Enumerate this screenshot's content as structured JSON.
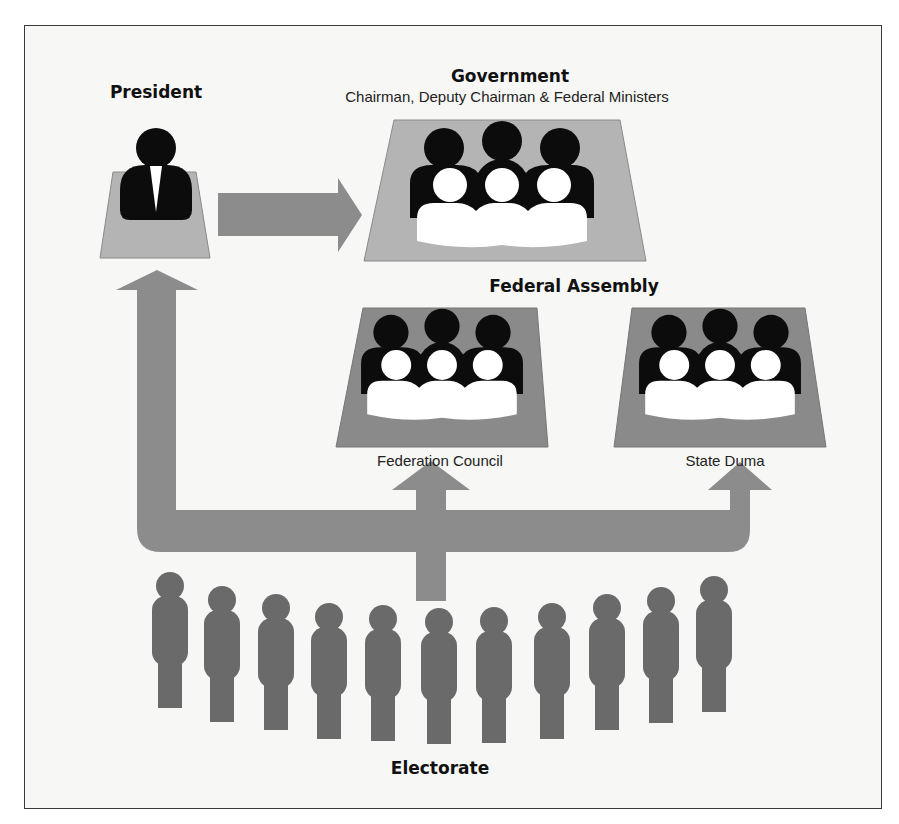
{
  "diagram": {
    "colors": {
      "background": "#f7f7f5",
      "frame_border": "#3a3a3a",
      "arrow": "#8c8c8c",
      "platform_light": "#b4b4b4",
      "platform_dark": "#8a8a8a",
      "person_dark": "#0c0c0c",
      "person_light": "#ffffff",
      "electorate_person": "#6a6a6a"
    },
    "nodes": {
      "president": {
        "label": "President"
      },
      "government": {
        "label": "Government",
        "sublabel": "Chairman, Deputy Chairman & Federal Ministers"
      },
      "federal_assembly": {
        "label": "Federal Assembly"
      },
      "federation_council": {
        "label": "Federation Council"
      },
      "state_duma": {
        "label": "State Duma"
      },
      "electorate": {
        "label": "Electorate",
        "person_count": 11
      }
    },
    "edges": [
      {
        "from": "President",
        "to": "Government",
        "type": "appoints"
      },
      {
        "from": "Electorate",
        "to": "President",
        "type": "elects"
      },
      {
        "from": "Electorate",
        "to": "Federation Council",
        "type": "elects"
      },
      {
        "from": "Electorate",
        "to": "State Duma",
        "type": "elects"
      }
    ]
  }
}
